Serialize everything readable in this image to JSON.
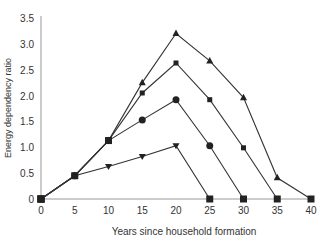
{
  "chart_data": {
    "type": "line",
    "title": "",
    "xlabel": "Years since household formation",
    "ylabel": "Energy dependency ratio",
    "xlim": [
      0,
      40
    ],
    "ylim": [
      0,
      3.5
    ],
    "x_ticks": [
      0,
      5,
      10,
      15,
      20,
      25,
      30,
      35,
      40
    ],
    "y_ticks": [
      0,
      0.5,
      1.0,
      1.5,
      2.0,
      2.5,
      3.0,
      3.5
    ],
    "y_tick_labels": [
      "0",
      "0.5",
      "1.0",
      "1.5",
      "2.0",
      "2.5",
      "3.0",
      "3.5"
    ],
    "grid": false,
    "legend": null,
    "series": [
      {
        "name": "triangle",
        "marker": "triangle-up",
        "x": [
          0,
          5,
          10,
          15,
          20,
          25,
          30,
          35,
          40
        ],
        "values": [
          0,
          0.45,
          1.13,
          2.25,
          3.2,
          2.67,
          1.96,
          0.41,
          0
        ]
      },
      {
        "name": "small-square",
        "marker": "square",
        "x": [
          0,
          5,
          10,
          15,
          20,
          25,
          30,
          35
        ],
        "values": [
          0,
          0.45,
          1.13,
          2.05,
          2.63,
          1.92,
          0.99,
          0
        ]
      },
      {
        "name": "circle",
        "marker": "circle",
        "x": [
          0,
          5,
          10,
          15,
          20,
          25,
          30
        ],
        "values": [
          0,
          0.45,
          1.13,
          1.53,
          1.92,
          1.03,
          0
        ]
      },
      {
        "name": "down-triangle",
        "marker": "triangle-down",
        "x": [
          0,
          5,
          10,
          15,
          20,
          25
        ],
        "values": [
          0,
          0.45,
          0.63,
          0.82,
          1.03,
          0
        ]
      }
    ],
    "colors": {
      "line": "#333333",
      "axis": "#999999",
      "marker": "#222222"
    }
  }
}
